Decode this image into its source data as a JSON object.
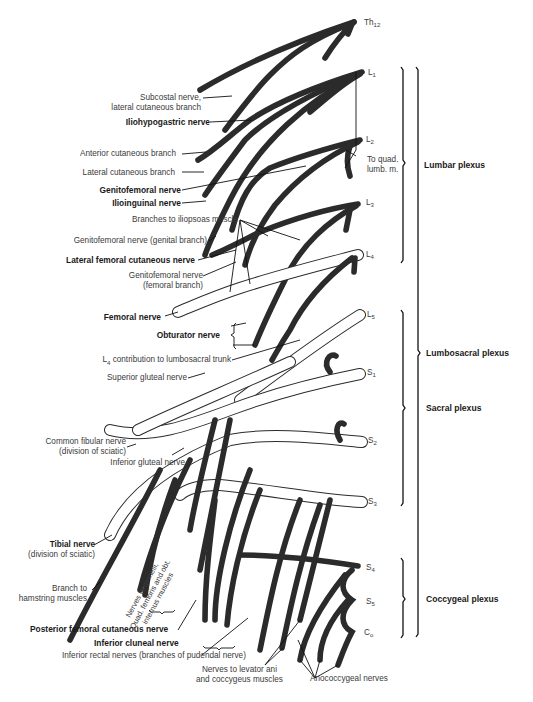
{
  "figure": {
    "colors": {
      "background": "#ffffff",
      "nerve_outline": "#2b2b2b",
      "label_text": "#3a3a3a",
      "bold_text": "#1a1a1a"
    }
  },
  "segments": [
    {
      "id": "th12",
      "base": "Th",
      "sub": "12"
    },
    {
      "id": "l1",
      "base": "L",
      "sub": "1"
    },
    {
      "id": "l2",
      "base": "L",
      "sub": "2"
    },
    {
      "id": "l3",
      "base": "L",
      "sub": "3"
    },
    {
      "id": "l4",
      "base": "L",
      "sub": "4"
    },
    {
      "id": "l5",
      "base": "L",
      "sub": "5"
    },
    {
      "id": "s1",
      "base": "S",
      "sub": "1"
    },
    {
      "id": "s2",
      "base": "S",
      "sub": "2"
    },
    {
      "id": "s3",
      "base": "S",
      "sub": "3"
    },
    {
      "id": "s4",
      "base": "S",
      "sub": "4"
    },
    {
      "id": "s5",
      "base": "S",
      "sub": "5"
    },
    {
      "id": "co",
      "base": "C",
      "sub": "o"
    }
  ],
  "plexuses": {
    "lumbar": "Lumbar plexus",
    "lumbosacral": "Lumbosacral plexus",
    "sacral": "Sacral plexus",
    "coccygeal": "Coccygeal plexus"
  },
  "labels": {
    "subcostal_1": "Subcostal nerve,",
    "subcostal_2": "lateral cutaneous branch",
    "iliohypogastric": "Iliohypogastric nerve",
    "anterior_cutaneous": "Anterior cutaneous branch",
    "lateral_cutaneous": "Lateral cutaneous branch",
    "to_quad_1": "To quad.",
    "to_quad_2": "lumb. m.",
    "genitofemoral": "Genitofemoral nerve",
    "ilioinguinal": "Ilioinguinal nerve",
    "iliopsoas": "Branches to iliopsoas muscle",
    "genitofemoral_genital": "Genitofemoral nerve (genital branch)",
    "lateral_femoral_cutaneous": "Lateral femoral cutaneous nerve",
    "genitofemoral_femoral_1": "Genitofemoral nerve",
    "genitofemoral_femoral_2": "(femoral branch)",
    "femoral": "Femoral nerve",
    "obturator": "Obturator nerve",
    "l4_contribution_base": "L",
    "l4_contribution_sub": "4",
    "l4_contribution_rest": " contribution to lumbosacral trunk",
    "superior_gluteal": "Superior gluteal nerve",
    "common_fibular_1": "Common fibular nerve",
    "common_fibular_2": "(division of sciatic)",
    "inferior_gluteal": "Inferior gluteal nerve",
    "tibial_1": "Tibial nerve",
    "tibial_2": "(division of sciatic)",
    "branch_hamstring_1": "Branch to",
    "branch_hamstring_2": "hamstring muscles",
    "nerves_gemelli_1": "Nerves to gemelli,",
    "nerves_gemelli_2": "Quad. femoris and obt.",
    "nerves_gemelli_3": "internus muscles",
    "posterior_femoral_cutaneous": "Posterior femoral cutaneous nerve",
    "inferior_cluneal": "Inferior cluneal nerve",
    "inferior_rectal": "Inferior rectal nerves (branches of pudendal nerve)",
    "levator_ani_1": "Nerves to levator ani",
    "levator_ani_2": "and coccygeus muscles",
    "anococcygeal": "Anococcygeal nerves"
  }
}
